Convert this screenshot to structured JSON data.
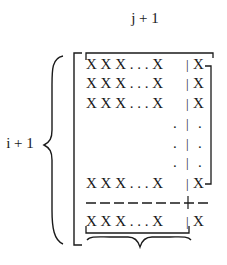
{
  "labels": {
    "column_count": "j + 1",
    "row_count": "i + 1"
  },
  "matrix": {
    "rows": [
      {
        "left": "X X X . . . X",
        "sep": "|",
        "right": "X"
      },
      {
        "left": "X X X . . . X",
        "sep": "|",
        "right": "X"
      },
      {
        "left": "X X X . . . X",
        "sep": "|",
        "right": "X"
      },
      {
        "left": ".",
        "sep": "|",
        "right": "."
      },
      {
        "left": ".",
        "sep": "|",
        "right": "."
      },
      {
        "left": ".",
        "sep": "|",
        "right": "."
      },
      {
        "left": "X X X . . . X",
        "sep": "|",
        "right": "X"
      },
      {
        "left": "X X X . . . X",
        "sep": "|",
        "right": "X"
      }
    ],
    "dashed_separator": "— — — — — — — + —"
  }
}
